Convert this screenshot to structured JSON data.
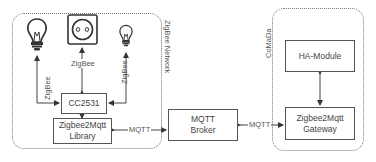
{
  "groups": {
    "zigbee_network": "ZigBee Network",
    "comada": "CoMaDa"
  },
  "nodes": {
    "cc2531": "CC2531",
    "library_line1": "Zigbee2Mqtt",
    "library_line2": "Library",
    "broker_line1": "MQTT",
    "broker_line2": "Broker",
    "ha_module": "HA-Module",
    "gateway_line1": "Zigbee2Mqtt",
    "gateway_line2": "Gateway"
  },
  "devices": [
    {
      "icon": "light-bulb-icon",
      "link_label": "ZigBee"
    },
    {
      "icon": "power-socket-icon",
      "link_label": "ZigBee"
    },
    {
      "icon": "light-bulb-small-icon",
      "link_label": "ZigBee"
    }
  ],
  "edges": {
    "library_broker": "MQTT",
    "broker_gateway": "MQTT"
  },
  "colors": {
    "line": "#444444",
    "group_border": "#777777"
  }
}
